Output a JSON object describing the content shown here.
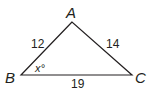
{
  "diagram": {
    "type": "triangle",
    "vertices": {
      "A": {
        "label": "A",
        "x": 72,
        "y": 22
      },
      "B": {
        "label": "B",
        "x": 21,
        "y": 75
      },
      "C": {
        "label": "C",
        "x": 132,
        "y": 75
      }
    },
    "sides": {
      "AB": {
        "label": "12"
      },
      "AC": {
        "label": "14"
      },
      "BC": {
        "label": "19"
      }
    },
    "angle_B": {
      "label": "x°"
    },
    "stroke_color": "#231f20"
  }
}
